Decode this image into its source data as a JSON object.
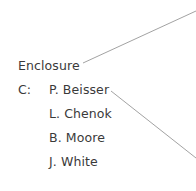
{
  "enclosure_label": "Enclosure",
  "cc_label": "C:",
  "cc_recipients": [
    {
      "name": "P. Beisser"
    },
    {
      "name": "L. Chenok"
    },
    {
      "name": "B. Moore"
    },
    {
      "name": "J. White"
    }
  ],
  "colors": {
    "text": "#3a3a3a",
    "leader_line": "#8a8a8a"
  }
}
